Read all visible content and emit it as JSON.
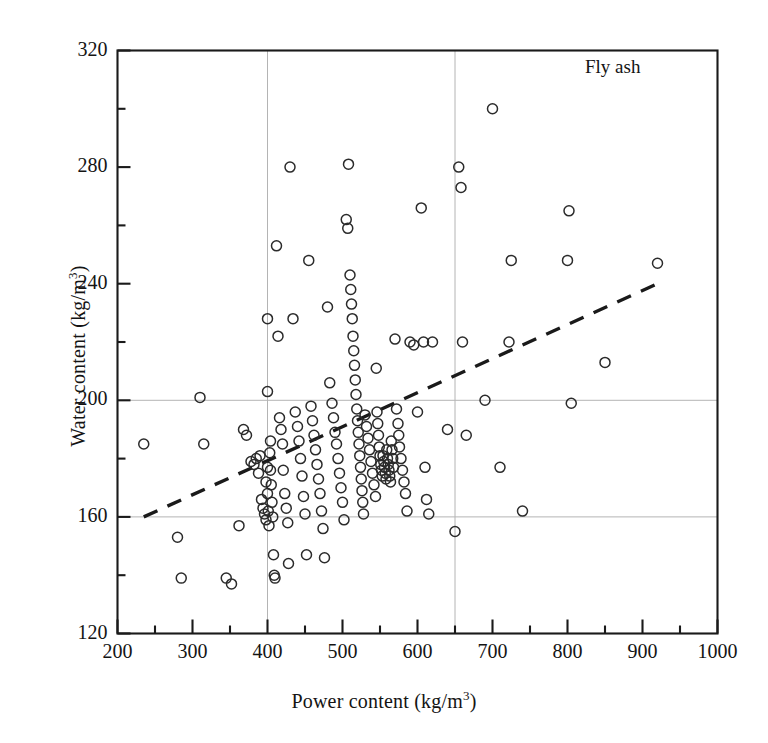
{
  "chart_data": {
    "type": "scatter",
    "title": "",
    "annotation": "Fly ash",
    "xlabel": "Power content (kg/m3)",
    "xlabel_base": "Power content (kg/m",
    "xlabel_sup": "3",
    "xlabel_tail": ")",
    "ylabel": "Water content (kg/m3)",
    "ylabel_base": "Water content (kg/m",
    "ylabel_sup": "3",
    "ylabel_tail": ")",
    "xlim": [
      200,
      1000
    ],
    "ylim": [
      120,
      320
    ],
    "xticks": [
      200,
      300,
      400,
      500,
      600,
      700,
      800,
      900,
      1000
    ],
    "yticks": [
      120,
      160,
      200,
      240,
      280,
      320
    ],
    "x_minor_tick_step": 50,
    "y_minor_tick_step": 20,
    "grid": true,
    "gridlines_x": [
      400,
      650
    ],
    "gridlines_y": [
      160,
      200
    ],
    "grid_color": "#b4b4b4",
    "marker": "open-circle",
    "marker_color": "#2b2b2b",
    "marker_radius_px": 5,
    "legend": "none",
    "trendline": {
      "style": "dashed",
      "color": "#1a1a1a",
      "x": [
        235,
        920
      ],
      "y": [
        160,
        240
      ]
    },
    "points": [
      [
        235,
        185
      ],
      [
        280,
        153
      ],
      [
        285,
        139
      ],
      [
        310,
        201
      ],
      [
        315,
        185
      ],
      [
        345,
        139
      ],
      [
        352,
        137
      ],
      [
        362,
        157
      ],
      [
        368,
        190
      ],
      [
        372,
        188
      ],
      [
        378,
        179
      ],
      [
        382,
        178
      ],
      [
        385,
        180
      ],
      [
        388,
        175
      ],
      [
        390,
        181
      ],
      [
        392,
        166
      ],
      [
        394,
        163
      ],
      [
        396,
        161
      ],
      [
        398,
        159
      ],
      [
        398,
        172
      ],
      [
        400,
        203
      ],
      [
        400,
        228
      ],
      [
        400,
        177
      ],
      [
        400,
        168
      ],
      [
        401,
        162
      ],
      [
        402,
        157
      ],
      [
        403,
        182
      ],
      [
        404,
        186
      ],
      [
        404,
        176
      ],
      [
        405,
        171
      ],
      [
        406,
        165
      ],
      [
        407,
        160
      ],
      [
        408,
        147
      ],
      [
        409,
        140
      ],
      [
        410,
        139
      ],
      [
        412,
        253
      ],
      [
        414,
        222
      ],
      [
        416,
        194
      ],
      [
        418,
        190
      ],
      [
        420,
        185
      ],
      [
        421,
        176
      ],
      [
        423,
        168
      ],
      [
        425,
        163
      ],
      [
        427,
        158
      ],
      [
        428,
        144
      ],
      [
        430,
        280
      ],
      [
        434,
        228
      ],
      [
        437,
        196
      ],
      [
        440,
        191
      ],
      [
        442,
        186
      ],
      [
        444,
        180
      ],
      [
        446,
        174
      ],
      [
        448,
        167
      ],
      [
        450,
        161
      ],
      [
        452,
        147
      ],
      [
        455,
        248
      ],
      [
        458,
        198
      ],
      [
        460,
        193
      ],
      [
        462,
        188
      ],
      [
        464,
        183
      ],
      [
        466,
        178
      ],
      [
        468,
        173
      ],
      [
        470,
        168
      ],
      [
        472,
        162
      ],
      [
        474,
        156
      ],
      [
        476,
        146
      ],
      [
        480,
        232
      ],
      [
        483,
        206
      ],
      [
        486,
        199
      ],
      [
        488,
        194
      ],
      [
        490,
        189
      ],
      [
        492,
        185
      ],
      [
        494,
        180
      ],
      [
        496,
        175
      ],
      [
        498,
        170
      ],
      [
        500,
        165
      ],
      [
        502,
        159
      ],
      [
        505,
        262
      ],
      [
        507,
        259
      ],
      [
        508,
        281
      ],
      [
        510,
        243
      ],
      [
        511,
        238
      ],
      [
        512,
        233
      ],
      [
        513,
        228
      ],
      [
        514,
        222
      ],
      [
        515,
        217
      ],
      [
        516,
        212
      ],
      [
        517,
        207
      ],
      [
        518,
        202
      ],
      [
        519,
        197
      ],
      [
        520,
        193
      ],
      [
        521,
        189
      ],
      [
        522,
        185
      ],
      [
        523,
        181
      ],
      [
        524,
        177
      ],
      [
        525,
        173
      ],
      [
        526,
        169
      ],
      [
        527,
        165
      ],
      [
        528,
        161
      ],
      [
        530,
        195
      ],
      [
        532,
        191
      ],
      [
        534,
        187
      ],
      [
        536,
        183
      ],
      [
        538,
        179
      ],
      [
        540,
        175
      ],
      [
        542,
        171
      ],
      [
        544,
        167
      ],
      [
        545,
        211
      ],
      [
        546,
        196
      ],
      [
        547,
        192
      ],
      [
        548,
        188
      ],
      [
        549,
        184
      ],
      [
        550,
        181
      ],
      [
        551,
        178
      ],
      [
        552,
        176
      ],
      [
        553,
        174
      ],
      [
        554,
        181
      ],
      [
        555,
        179
      ],
      [
        556,
        177
      ],
      [
        557,
        175
      ],
      [
        558,
        173
      ],
      [
        559,
        183
      ],
      [
        560,
        180
      ],
      [
        561,
        178
      ],
      [
        562,
        176
      ],
      [
        563,
        174
      ],
      [
        564,
        172
      ],
      [
        565,
        186
      ],
      [
        566,
        183
      ],
      [
        567,
        180
      ],
      [
        568,
        177
      ],
      [
        570,
        221
      ],
      [
        572,
        197
      ],
      [
        574,
        192
      ],
      [
        575,
        188
      ],
      [
        576,
        184
      ],
      [
        578,
        180
      ],
      [
        580,
        176
      ],
      [
        582,
        172
      ],
      [
        584,
        168
      ],
      [
        586,
        162
      ],
      [
        590,
        220
      ],
      [
        595,
        219
      ],
      [
        600,
        196
      ],
      [
        605,
        266
      ],
      [
        608,
        220
      ],
      [
        610,
        177
      ],
      [
        612,
        166
      ],
      [
        615,
        161
      ],
      [
        620,
        220
      ],
      [
        640,
        190
      ],
      [
        650,
        155
      ],
      [
        655,
        280
      ],
      [
        658,
        273
      ],
      [
        660,
        220
      ],
      [
        665,
        188
      ],
      [
        690,
        200
      ],
      [
        700,
        300
      ],
      [
        710,
        177
      ],
      [
        722,
        220
      ],
      [
        725,
        248
      ],
      [
        740,
        162
      ],
      [
        800,
        248
      ],
      [
        802,
        265
      ],
      [
        805,
        199
      ],
      [
        850,
        213
      ],
      [
        920,
        247
      ]
    ]
  }
}
